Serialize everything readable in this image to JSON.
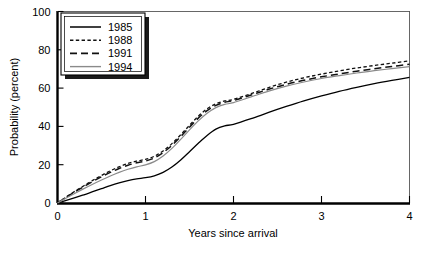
{
  "chart_data": {
    "type": "line",
    "title": "",
    "xlabel": "Years since arrival",
    "ylabel": "Probability (percent)",
    "xlim": [
      0,
      4
    ],
    "ylim": [
      0,
      100
    ],
    "xticks": [
      "0",
      "1",
      "2",
      "3",
      "4"
    ],
    "xtick_values": [
      0,
      1,
      2,
      3,
      4
    ],
    "yticks": [
      "0",
      "20",
      "40",
      "60",
      "80",
      "100"
    ],
    "ytick_values": [
      0,
      20,
      40,
      60,
      80,
      100
    ],
    "grid": false,
    "legend_position": "top-left",
    "x": [
      0,
      0.1,
      0.2,
      0.3,
      0.4,
      0.5,
      0.6,
      0.7,
      0.8,
      0.9,
      1.0,
      1.1,
      1.2,
      1.3,
      1.4,
      1.5,
      1.6,
      1.7,
      1.8,
      1.9,
      2.0,
      2.2,
      2.4,
      2.6,
      2.8,
      3.0,
      3.2,
      3.4,
      3.6,
      3.8,
      4.0
    ],
    "series": [
      {
        "name": "1985",
        "style": "solid",
        "color": "#000000",
        "width": 1.3,
        "values": [
          0,
          1.4,
          2.8,
          4.3,
          5.9,
          7.5,
          9.1,
          10.5,
          11.7,
          12.6,
          13.2,
          14.2,
          16.0,
          18.8,
          22.5,
          26.8,
          31.2,
          35.3,
          38.6,
          40.3,
          41.1,
          44.0,
          47.3,
          50.4,
          53.3,
          55.9,
          58.3,
          60.4,
          62.3,
          64.0,
          65.6
        ]
      },
      {
        "name": "1988",
        "style": "dotted-dash",
        "color": "#111111",
        "width": 1.3,
        "values": [
          0,
          3.2,
          6.2,
          9.0,
          11.8,
          14.4,
          16.8,
          18.9,
          20.6,
          21.9,
          22.8,
          24.4,
          27.2,
          31.0,
          35.6,
          40.6,
          45.3,
          49.2,
          51.8,
          53.3,
          54.1,
          57.1,
          60.3,
          63.1,
          65.4,
          67.3,
          69.0,
          70.5,
          71.8,
          73.0,
          74.2
        ]
      },
      {
        "name": "1991",
        "style": "dashed",
        "color": "#111111",
        "width": 1.5,
        "values": [
          0,
          3.0,
          5.9,
          8.6,
          11.2,
          13.7,
          16.0,
          18.0,
          19.7,
          21.0,
          21.9,
          23.5,
          26.3,
          30.1,
          34.7,
          39.6,
          44.3,
          48.2,
          51.0,
          52.6,
          53.5,
          56.4,
          59.4,
          62.0,
          64.1,
          65.9,
          67.4,
          68.8,
          70.1,
          71.3,
          72.4
        ]
      },
      {
        "name": "1994",
        "style": "solid-gray",
        "color": "#8a8a8a",
        "width": 1.2,
        "values": [
          0,
          2.6,
          5.1,
          7.5,
          9.8,
          12.0,
          14.1,
          16.0,
          17.6,
          18.9,
          19.9,
          21.6,
          24.5,
          28.5,
          33.2,
          38.2,
          42.9,
          46.9,
          49.8,
          51.5,
          52.4,
          55.4,
          58.4,
          61.0,
          63.2,
          65.0,
          66.5,
          67.9,
          69.1,
          70.2,
          71.2
        ]
      }
    ]
  },
  "legend": {
    "entries": [
      {
        "label": "1985"
      },
      {
        "label": "1988"
      },
      {
        "label": "1991"
      },
      {
        "label": "1994"
      }
    ]
  }
}
